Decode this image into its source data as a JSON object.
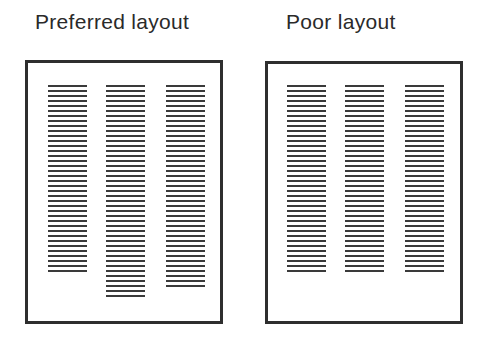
{
  "panels": [
    {
      "id": "preferred",
      "title": "Preferred layout",
      "title_x": 35,
      "frame": {
        "x": 25,
        "y": 60,
        "w": 198,
        "h": 264
      },
      "line_start_y": 85,
      "line_spacing": 5,
      "columns": [
        {
          "x": 48,
          "lines": 38
        },
        {
          "x": 106,
          "lines": 43
        },
        {
          "x": 166,
          "lines": 41
        }
      ]
    },
    {
      "id": "poor",
      "title": "Poor layout",
      "title_x": 286,
      "frame": {
        "x": 265,
        "y": 61,
        "w": 198,
        "h": 263
      },
      "line_start_y": 85,
      "line_spacing": 5,
      "columns": [
        {
          "x": 287,
          "lines": 38
        },
        {
          "x": 345,
          "lines": 38
        },
        {
          "x": 405,
          "lines": 38
        }
      ]
    }
  ],
  "colors": {
    "ink": "#2e2e2e",
    "lines": "#3a3a3a",
    "background": "#ffffff"
  }
}
